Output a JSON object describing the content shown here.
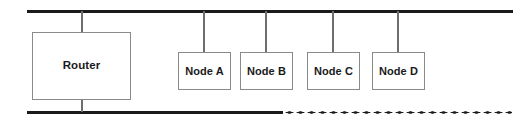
{
  "diagram": {
    "type": "network-bus-topology",
    "canvas": {
      "width": 532,
      "height": 130,
      "background": "#ffffff"
    },
    "colors": {
      "bus": "#1a1a1a",
      "drop_line": "#6e6e6e",
      "box_border": "#8a8a8a",
      "box_fill": "#ffffff",
      "label_text": "#1a1a1a"
    },
    "buses": {
      "top": {
        "name": "top-bus",
        "style": "solid",
        "x_start": 27,
        "x_end": 513,
        "y": 10,
        "thickness": 3
      },
      "bottom_solid": {
        "name": "bottom-bus-solid",
        "style": "solid",
        "x_start": 27,
        "x_end": 283,
        "y": 111,
        "thickness": 3
      },
      "bottom_dotted": {
        "name": "bottom-bus-dotted",
        "style": "dotted",
        "x_start": 284,
        "x_end": 512,
        "y": 111,
        "dot_spacing": 11
      }
    },
    "devices": [
      {
        "id": "router",
        "label": "Router",
        "shape": "rectangle",
        "x": 32,
        "y": 32,
        "width": 99,
        "height": 68,
        "connects_to": [
          "top-bus",
          "bottom-bus-solid"
        ]
      },
      {
        "id": "node-a",
        "label": "Node A",
        "shape": "rectangle",
        "x": 178,
        "y": 52,
        "width": 53,
        "height": 38,
        "connects_to": [
          "top-bus"
        ]
      },
      {
        "id": "node-b",
        "label": "Node B",
        "shape": "rectangle",
        "x": 240,
        "y": 52,
        "width": 53,
        "height": 38,
        "connects_to": [
          "top-bus"
        ]
      },
      {
        "id": "node-c",
        "label": "Node C",
        "shape": "rectangle",
        "x": 307,
        "y": 52,
        "width": 53,
        "height": 38,
        "connects_to": [
          "top-bus"
        ]
      },
      {
        "id": "node-d",
        "label": "Node D",
        "shape": "rectangle",
        "x": 372,
        "y": 52,
        "width": 53,
        "height": 38,
        "connects_to": [
          "top-bus"
        ]
      }
    ]
  }
}
